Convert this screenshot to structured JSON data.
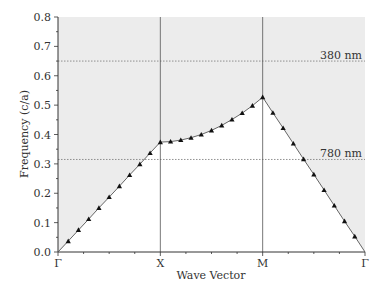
{
  "chart_data": {
    "type": "line",
    "title": "",
    "xlabel": "Wave Vector",
    "ylabel": "Frequency (c/a)",
    "ylim": [
      0.0,
      0.8
    ],
    "yticks": [
      "0.0",
      "0.1",
      "0.2",
      "0.3",
      "0.4",
      "0.5",
      "0.6",
      "0.7",
      "0.8"
    ],
    "xticks": [
      "Γ",
      "X",
      "M",
      "Γ"
    ],
    "grid": false,
    "legend": null,
    "annotations": [
      {
        "label": "380 nm",
        "y": 0.65,
        "style": "dotted horizontal line"
      },
      {
        "label": "780 nm",
        "y": 0.315,
        "style": "dotted horizontal line"
      }
    ],
    "shaded_region": "light cone (above band edge) shaded gray",
    "series": [
      {
        "name": "band (triangle markers)",
        "segment": "Γ-X",
        "k": [
          0.1,
          0.2,
          0.3,
          0.4,
          0.5,
          0.6,
          0.7,
          0.8,
          0.9,
          1.0
        ],
        "values": [
          0.037,
          0.075,
          0.112,
          0.15,
          0.187,
          0.224,
          0.262,
          0.299,
          0.337,
          0.374
        ]
      },
      {
        "name": "band (triangle markers)",
        "segment": "X-M",
        "k": [
          1.0,
          1.1,
          1.2,
          1.3,
          1.4,
          1.5,
          1.6,
          1.7,
          1.8,
          1.9,
          2.0
        ],
        "values": [
          0.374,
          0.376,
          0.381,
          0.389,
          0.4,
          0.414,
          0.431,
          0.451,
          0.473,
          0.498,
          0.527
        ]
      },
      {
        "name": "band (triangle markers)",
        "segment": "M-Γ",
        "k": [
          2.0,
          2.1,
          2.2,
          2.3,
          2.4,
          2.5,
          2.6,
          2.7,
          2.8,
          2.9,
          3.0
        ],
        "values": [
          0.527,
          0.474,
          0.422,
          0.369,
          0.316,
          0.264,
          0.211,
          0.158,
          0.105,
          0.053,
          0.0
        ]
      }
    ]
  },
  "labels": {
    "xlabel": "Wave Vector",
    "ylabel": "Frequency (c/a)",
    "ann1": "380 nm",
    "ann2": "780 nm"
  },
  "colors": {
    "shade": "#ececec",
    "axis": "#333333",
    "line": "#555555",
    "marker": "#111111",
    "dotted": "#777777"
  }
}
